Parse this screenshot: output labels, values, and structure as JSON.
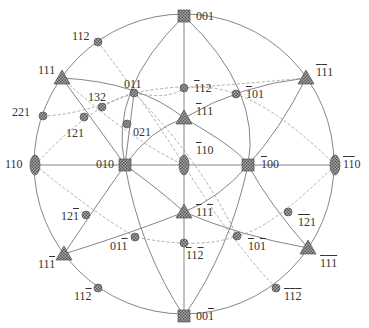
{
  "diagram": {
    "type": "stereographic-projection",
    "center": [
      184,
      164
    ],
    "radius": 150,
    "colors": {
      "line": "#777777",
      "dashed": "#999999",
      "marker_fill": "#8a8a8a",
      "text": "#333333"
    },
    "poles": [
      {
        "id": "p001",
        "label": "001",
        "marker": "square",
        "x": 184,
        "y": 16,
        "lx": 196,
        "ly": 10
      },
      {
        "id": "p00-1",
        "label": "00̅1",
        "parts": [
          "00",
          "1"
        ],
        "marker": "square",
        "x": 184,
        "y": 316,
        "lx": 196,
        "ly": 310
      },
      {
        "id": "p110",
        "label": "110",
        "marker": "ellipse",
        "x": 35,
        "y": 165,
        "lx": 5,
        "ly": 158
      },
      {
        "id": "p-1-10",
        "label": "110",
        "bars": [
          0,
          1
        ],
        "marker": "ellipse",
        "x": 335,
        "y": 165,
        "lx": 343,
        "ly": 158
      },
      {
        "id": "p010",
        "label": "010",
        "marker": "square",
        "x": 125,
        "y": 165,
        "lx": 96,
        "ly": 158
      },
      {
        "id": "p-100",
        "label": "100",
        "bars": [
          0
        ],
        "marker": "square",
        "x": 248,
        "y": 165,
        "lx": 261,
        "ly": 158
      },
      {
        "id": "p-110",
        "label": "110",
        "bars": [
          0
        ],
        "marker": "ellipse",
        "x": 184,
        "y": 165,
        "lx": 196,
        "ly": 144
      },
      {
        "id": "p111",
        "label": "111",
        "marker": "triangle",
        "x": 62,
        "y": 78,
        "lx": 38,
        "ly": 64
      },
      {
        "id": "p-1-11",
        "label": "111",
        "bars": [
          0,
          1
        ],
        "marker": "triangle",
        "x": 306,
        "y": 78,
        "lx": 316,
        "ly": 66
      },
      {
        "id": "p11-1",
        "label": "111",
        "bars": [
          2
        ],
        "marker": "triangle",
        "x": 64,
        "y": 254,
        "lx": 38,
        "ly": 258
      },
      {
        "id": "p-1-1-1",
        "label": "111",
        "bars": [
          0,
          1,
          2
        ],
        "marker": "triangle",
        "x": 308,
        "y": 248,
        "lx": 320,
        "ly": 257
      },
      {
        "id": "p-111",
        "label": "111",
        "bars": [
          0
        ],
        "marker": "triangle",
        "x": 184,
        "y": 118,
        "lx": 196,
        "ly": 105
      },
      {
        "id": "p-11-1",
        "label": "111",
        "bars": [
          0,
          2
        ],
        "marker": "triangle",
        "x": 184,
        "y": 212,
        "lx": 196,
        "ly": 206
      },
      {
        "id": "p112",
        "label": "112",
        "marker": "circle",
        "x": 98,
        "y": 42,
        "lx": 72,
        "ly": 30
      },
      {
        "id": "p011",
        "label": "011",
        "marker": "circle",
        "x": 134,
        "y": 93,
        "lx": 124,
        "ly": 78
      },
      {
        "id": "p-112",
        "label": "112",
        "bars": [
          0
        ],
        "marker": "circle",
        "x": 184,
        "y": 88,
        "lx": 194,
        "ly": 82
      },
      {
        "id": "p-101",
        "label": "101",
        "bars": [
          0
        ],
        "marker": "circle",
        "x": 236,
        "y": 94,
        "lx": 246,
        "ly": 88
      },
      {
        "id": "p221",
        "label": "221",
        "marker": "circle",
        "x": 43,
        "y": 116,
        "lx": 12,
        "ly": 106
      },
      {
        "id": "p132",
        "label": "132",
        "marker": "circle",
        "x": 102,
        "y": 107,
        "lx": 88,
        "ly": 91
      },
      {
        "id": "p121",
        "label": "121",
        "marker": "circle",
        "x": 84,
        "y": 117,
        "lx": 66,
        "ly": 127
      },
      {
        "id": "p021",
        "label": "021",
        "marker": "circle",
        "x": 127,
        "y": 124,
        "lx": 133,
        "ly": 126
      },
      {
        "id": "p12-1",
        "label": "121",
        "bars": [
          2
        ],
        "marker": "circle",
        "x": 86,
        "y": 215,
        "lx": 61,
        "ly": 210
      },
      {
        "id": "p01-1",
        "label": "011",
        "bars": [
          2
        ],
        "marker": "circle",
        "x": 135,
        "y": 237,
        "lx": 110,
        "ly": 240
      },
      {
        "id": "p11-2",
        "label": "112",
        "bars": [
          2
        ],
        "marker": "circle",
        "x": 98,
        "y": 288,
        "lx": 74,
        "ly": 290
      },
      {
        "id": "p-11-2",
        "label": "112",
        "bars": [
          0,
          2
        ],
        "marker": "circle",
        "x": 184,
        "y": 243,
        "lx": 186,
        "ly": 249
      },
      {
        "id": "p-10-1",
        "label": "101",
        "bars": [
          0,
          2
        ],
        "marker": "circle",
        "x": 237,
        "y": 236,
        "lx": 248,
        "ly": 240
      },
      {
        "id": "p-1-21",
        "label": "121",
        "bars": [
          0,
          1
        ],
        "marker": "circle",
        "x": 288,
        "y": 212,
        "lx": 298,
        "ly": 216
      },
      {
        "id": "p-1-1-2",
        "label": "112",
        "bars": [
          0,
          1,
          2
        ],
        "marker": "circle",
        "x": 276,
        "y": 288,
        "lx": 284,
        "ly": 290
      }
    ]
  }
}
